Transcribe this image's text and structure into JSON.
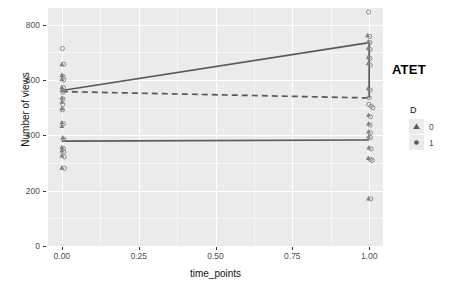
{
  "chart_data": {
    "type": "scatter",
    "title": "",
    "xlabel": "time_points",
    "ylabel": "Number of views",
    "xlim": [
      -0.045,
      1.045
    ],
    "ylim": [
      0,
      860
    ],
    "xticks": [
      "0.00",
      "0.25",
      "0.50",
      "0.75",
      "1.00"
    ],
    "xtick_values": [
      0,
      0.25,
      0.5,
      0.75,
      1
    ],
    "yticks": [
      "0",
      "200",
      "400",
      "600",
      "800"
    ],
    "ytick_values": [
      0,
      200,
      400,
      600,
      800
    ],
    "grid": true,
    "legend": {
      "title": "D",
      "position": "right",
      "entries": [
        {
          "label": "0",
          "marker": "triangle"
        },
        {
          "label": "1",
          "marker": "circle"
        }
      ]
    },
    "annotations": [
      {
        "text": "ATET",
        "x": 1.04,
        "y": 635
      }
    ],
    "series": [
      {
        "name": "treated-trend",
        "style": "solid",
        "color": "#595959",
        "x": [
          0,
          1
        ],
        "values": [
          562,
          735
        ]
      },
      {
        "name": "counterfactual-trend",
        "style": "dashed",
        "color": "#595959",
        "x": [
          0,
          1
        ],
        "values": [
          558,
          535
        ]
      },
      {
        "name": "control-trend",
        "style": "solid",
        "color": "#595959",
        "x": [
          0,
          1
        ],
        "values": [
          379,
          383
        ]
      },
      {
        "name": "atet-bracket",
        "style": "solid",
        "color": "#595959",
        "x": [
          1,
          1
        ],
        "values": [
          735,
          535
        ]
      }
    ],
    "points": [
      {
        "x": 0.002,
        "y": 714,
        "marker": "circle"
      },
      {
        "x": 0.0,
        "y": 657,
        "marker": "triangle"
      },
      {
        "x": 0.006,
        "y": 657,
        "marker": "circle"
      },
      {
        "x": 0.0,
        "y": 618,
        "marker": "triangle"
      },
      {
        "x": 0.004,
        "y": 613,
        "marker": "circle"
      },
      {
        "x": 0.0,
        "y": 604,
        "marker": "triangle"
      },
      {
        "x": 0.006,
        "y": 600,
        "marker": "circle"
      },
      {
        "x": 0.0,
        "y": 575,
        "marker": "triangle"
      },
      {
        "x": 0.005,
        "y": 572,
        "marker": "circle"
      },
      {
        "x": 0.0,
        "y": 564,
        "marker": "triangle"
      },
      {
        "x": 0.004,
        "y": 556,
        "marker": "circle"
      },
      {
        "x": 0.0,
        "y": 536,
        "marker": "triangle"
      },
      {
        "x": 0.004,
        "y": 531,
        "marker": "circle"
      },
      {
        "x": 0.0,
        "y": 521,
        "marker": "triangle"
      },
      {
        "x": 0.003,
        "y": 512,
        "marker": "circle"
      },
      {
        "x": 0.0,
        "y": 498,
        "marker": "triangle"
      },
      {
        "x": 0.002,
        "y": 492,
        "marker": "circle"
      },
      {
        "x": 0.0,
        "y": 447,
        "marker": "triangle"
      },
      {
        "x": 0.005,
        "y": 442,
        "marker": "circle"
      },
      {
        "x": 0.0,
        "y": 434,
        "marker": "triangle"
      },
      {
        "x": 0.003,
        "y": 392,
        "marker": "triangle"
      },
      {
        "x": 0.006,
        "y": 386,
        "marker": "circle"
      },
      {
        "x": 0.0,
        "y": 357,
        "marker": "triangle"
      },
      {
        "x": 0.005,
        "y": 352,
        "marker": "circle"
      },
      {
        "x": 0.0,
        "y": 345,
        "marker": "triangle"
      },
      {
        "x": 0.006,
        "y": 340,
        "marker": "circle"
      },
      {
        "x": 0.0,
        "y": 327,
        "marker": "triangle"
      },
      {
        "x": 0.008,
        "y": 322,
        "marker": "circle"
      },
      {
        "x": 0.0,
        "y": 283,
        "marker": "triangle"
      },
      {
        "x": 0.008,
        "y": 281,
        "marker": "circle"
      },
      {
        "x": 0.998,
        "y": 845,
        "marker": "circle"
      },
      {
        "x": 0.995,
        "y": 762,
        "marker": "triangle"
      },
      {
        "x": 1.002,
        "y": 757,
        "marker": "circle"
      },
      {
        "x": 0.997,
        "y": 739,
        "marker": "triangle"
      },
      {
        "x": 1.002,
        "y": 735,
        "marker": "circle"
      },
      {
        "x": 0.997,
        "y": 716,
        "marker": "triangle"
      },
      {
        "x": 1.003,
        "y": 710,
        "marker": "circle"
      },
      {
        "x": 0.997,
        "y": 684,
        "marker": "triangle"
      },
      {
        "x": 1.002,
        "y": 678,
        "marker": "circle"
      },
      {
        "x": 0.997,
        "y": 661,
        "marker": "triangle"
      },
      {
        "x": 1.003,
        "y": 653,
        "marker": "circle"
      },
      {
        "x": 0.997,
        "y": 570,
        "marker": "triangle"
      },
      {
        "x": 1.003,
        "y": 563,
        "marker": "circle"
      },
      {
        "x": 1.0,
        "y": 536,
        "marker": "circle"
      },
      {
        "x": 0.999,
        "y": 512,
        "marker": "circle"
      },
      {
        "x": 1.006,
        "y": 505,
        "marker": "circle"
      },
      {
        "x": 1.012,
        "y": 500,
        "marker": "circle"
      },
      {
        "x": 0.998,
        "y": 474,
        "marker": "triangle"
      },
      {
        "x": 1.004,
        "y": 467,
        "marker": "circle"
      },
      {
        "x": 0.998,
        "y": 443,
        "marker": "triangle"
      },
      {
        "x": 1.003,
        "y": 437,
        "marker": "circle"
      },
      {
        "x": 0.998,
        "y": 414,
        "marker": "triangle"
      },
      {
        "x": 1.004,
        "y": 409,
        "marker": "circle"
      },
      {
        "x": 0.998,
        "y": 396,
        "marker": "triangle"
      },
      {
        "x": 1.004,
        "y": 392,
        "marker": "circle"
      },
      {
        "x": 0.999,
        "y": 356,
        "marker": "triangle"
      },
      {
        "x": 1.006,
        "y": 351,
        "marker": "circle"
      },
      {
        "x": 0.997,
        "y": 318,
        "marker": "triangle"
      },
      {
        "x": 1.004,
        "y": 313,
        "marker": "circle"
      },
      {
        "x": 1.01,
        "y": 309,
        "marker": "circle"
      },
      {
        "x": 0.998,
        "y": 172,
        "marker": "triangle"
      },
      {
        "x": 1.005,
        "y": 170,
        "marker": "circle"
      }
    ]
  }
}
